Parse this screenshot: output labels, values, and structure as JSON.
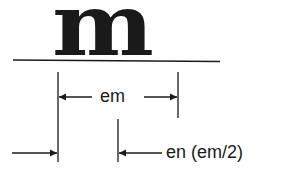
{
  "diagram": {
    "glyph": "m",
    "labels": {
      "em": "em",
      "en": "en (em/2)"
    },
    "colors": {
      "ink": "#1a1a1a",
      "background": "#ffffff"
    }
  }
}
